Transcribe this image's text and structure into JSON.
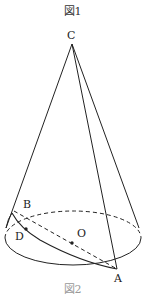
{
  "figure": {
    "title": "図1",
    "bottom_caption": "図2"
  },
  "points": {
    "apex": "C",
    "center": "O",
    "base_front": "A",
    "base_back": "B",
    "path_point": "D"
  },
  "colors": {
    "line": "#222222",
    "background": "#ffffff"
  }
}
